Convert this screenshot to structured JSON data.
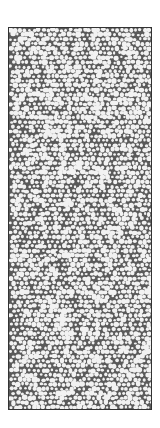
{
  "image": {
    "description": "Dense pebble / cellular texture inside a bordered rectangle",
    "colors": {
      "background": "#ffffff",
      "cell_fill": "#f2f2f2",
      "gap": "#5a5a5a",
      "border": "#333333"
    }
  }
}
